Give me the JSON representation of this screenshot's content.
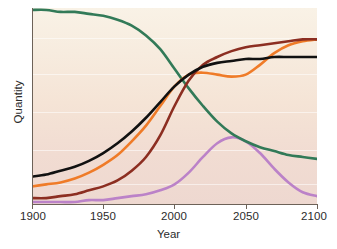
{
  "chart_data": {
    "type": "line",
    "title": "",
    "xlabel": "Year",
    "ylabel": "Quantity",
    "xlim": [
      1900,
      2100
    ],
    "ylim": [
      0,
      100
    ],
    "xticks": [
      1900,
      1950,
      2000,
      2050,
      2100
    ],
    "xtick_labels": [
      "1900",
      "1950",
      "2000",
      "2050",
      "2100"
    ],
    "yticks": [],
    "ytick_labels": [],
    "grid": "faint-horizontal",
    "legend": "none",
    "background": "#f6e9dc",
    "x": [
      1900,
      1910,
      1920,
      1930,
      1940,
      1950,
      1960,
      1970,
      1980,
      1990,
      2000,
      2010,
      2020,
      2030,
      2040,
      2050,
      2060,
      2070,
      2080,
      2090,
      2100
    ],
    "series": [
      {
        "name": "green-declining",
        "color": "#327a58",
        "values": [
          99,
          99,
          98,
          98,
          97,
          96,
          94,
          91,
          86,
          79,
          69,
          59,
          50,
          42,
          36,
          32,
          29,
          27,
          25,
          24,
          23
        ],
        "shape": "declining sigmoid from top-left to mid-right"
      },
      {
        "name": "black-rising",
        "color": "#111111",
        "values": [
          14,
          15,
          17,
          19,
          22,
          26,
          31,
          37,
          44,
          52,
          60,
          66,
          70,
          72,
          73,
          74,
          74,
          75,
          75,
          75,
          75
        ],
        "shape": "rising sigmoid, plateaus near 2040"
      },
      {
        "name": "orange-rising-dip",
        "color": "#ef7b28",
        "values": [
          9,
          10,
          11,
          13,
          16,
          20,
          25,
          32,
          40,
          50,
          60,
          66,
          67,
          66,
          65,
          66,
          71,
          77,
          81,
          83,
          84
        ],
        "shape": "rising sigmoid with plateau/dip 2015-2050 then second rise to top"
      },
      {
        "name": "maroon-rising",
        "color": "#8c2e21",
        "values": [
          3,
          3,
          4,
          5,
          7,
          9,
          12,
          17,
          24,
          35,
          50,
          63,
          71,
          75,
          78,
          80,
          81,
          82,
          83,
          84,
          84
        ],
        "shape": "rising sigmoid, steepest near 2000, plateaus top-right"
      },
      {
        "name": "purple-bell",
        "color": "#bb82c8",
        "values": [
          1,
          1,
          1,
          1,
          2,
          2,
          3,
          4,
          5,
          7,
          10,
          16,
          24,
          31,
          34,
          32,
          26,
          18,
          11,
          6,
          4
        ],
        "shape": "bell curve peaking about 2040"
      }
    ]
  },
  "axes": {
    "xlabel": "Year",
    "ylabel": "Quantity",
    "xtick_labels": [
      "1900",
      "1950",
      "2000",
      "2050",
      "2100"
    ]
  }
}
